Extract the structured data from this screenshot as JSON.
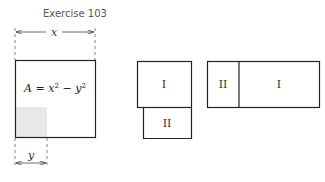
{
  "title": "Exercise 103",
  "figure1": {
    "dimension_x": "x",
    "dimension_y": "y",
    "area_formula_lhs": "A",
    "area_formula_eq": " = ",
    "area_formula_x": "x",
    "area_formula_minus": " − ",
    "area_formula_y": "y",
    "exponent": "2",
    "shaded_color": "#e8e8e8"
  },
  "figure2": {
    "region_top": "I",
    "region_bottom": "II"
  },
  "figure3": {
    "region_left": "II",
    "region_right": "I"
  },
  "colors": {
    "stroke": "#222222",
    "dashed": "#666666"
  }
}
